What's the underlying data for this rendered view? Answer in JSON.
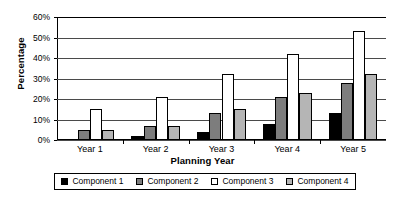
{
  "chart_data": {
    "type": "bar",
    "title": "",
    "xlabel": "Planning Year",
    "ylabel": "Percentage",
    "categories": [
      "Year 1",
      "Year 2",
      "Year 3",
      "Year 4",
      "Year 5"
    ],
    "series": [
      {
        "name": "Component 1",
        "color": "#000000",
        "values": [
          0,
          2,
          4,
          8,
          13
        ]
      },
      {
        "name": "Component 2",
        "color": "#7d7d7d",
        "values": [
          5,
          7,
          13,
          21,
          28
        ]
      },
      {
        "name": "Component 3",
        "color": "#ffffff",
        "values": [
          15,
          21,
          32,
          42,
          53
        ]
      },
      {
        "name": "Component 4",
        "color": "#b5b5b5",
        "values": [
          5,
          7,
          15,
          23,
          32
        ]
      }
    ],
    "ylim": [
      0,
      60
    ],
    "ytick_values": [
      0,
      10,
      20,
      30,
      40,
      50,
      60
    ],
    "ytick_labels": [
      "0%",
      "10%",
      "20%",
      "30%",
      "40%",
      "50%",
      "60%"
    ],
    "grid": true,
    "legend_position": "bottom",
    "value_suffix": "%"
  }
}
